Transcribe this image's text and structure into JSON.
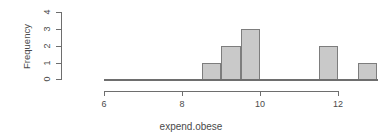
{
  "chart_data": {
    "type": "bar",
    "title": "",
    "xlabel": "expend.obese",
    "ylabel": "Frequency",
    "xlim": [
      5.6,
      13.1
    ],
    "ylim": [
      0,
      4
    ],
    "grid": false,
    "legend": "none",
    "bin_width": 0.5,
    "bins": [
      {
        "start": 8.5,
        "end": 9.0,
        "count": 1
      },
      {
        "start": 9.0,
        "end": 9.5,
        "count": 2
      },
      {
        "start": 9.5,
        "end": 10.0,
        "count": 3
      },
      {
        "start": 11.5,
        "end": 12.0,
        "count": 2
      },
      {
        "start": 12.5,
        "end": 13.0,
        "count": 1
      }
    ],
    "categories": [
      "8.5-9",
      "9-9.5",
      "9.5-10",
      "11.5-12",
      "12.5-13"
    ],
    "values": [
      1,
      2,
      3,
      2,
      1
    ],
    "x_ticks": [
      "6",
      "8",
      "10",
      "12"
    ],
    "x_tick_values": [
      6,
      8,
      10,
      12
    ],
    "y_ticks": [
      "0",
      "1",
      "2",
      "3",
      "4"
    ],
    "y_tick_values": [
      0,
      1,
      2,
      3,
      4
    ],
    "bar_fill_color": "#c9c9c9",
    "bar_border_color": "#7d7d7d",
    "axis_color": "#6e6e6e",
    "text_color": "#4a4a4a"
  }
}
